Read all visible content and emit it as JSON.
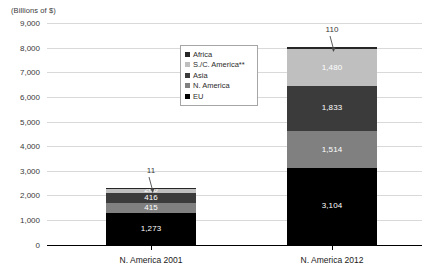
{
  "chart_data": {
    "type": "bar",
    "subtype": "stacked-bar",
    "title": "",
    "ylabel": "(Billions of $)",
    "xlabel": "",
    "ylim": [
      0,
      9000
    ],
    "ytick_labels": [
      "9,000",
      "8,000",
      "7,000",
      "6,000",
      "5,000",
      "4,000",
      "3,000",
      "2,000",
      "1,000",
      "0"
    ],
    "ytick_values": [
      9000,
      8000,
      7000,
      6000,
      5000,
      4000,
      3000,
      2000,
      1000,
      0
    ],
    "grid": true,
    "legend_position": "inside-upper-center",
    "categories": [
      "N. America 2001",
      "N. America 2012"
    ],
    "series": [
      {
        "name": "EU",
        "values": [
          1273,
          3104
        ],
        "labels": [
          "1,273",
          "3,104"
        ],
        "color": "#000000",
        "label_color": "#ffffff"
      },
      {
        "name": "N. America",
        "values": [
          415,
          1514
        ],
        "labels": [
          "415",
          "1,514"
        ],
        "color": "#808080",
        "label_color": "#ffffff"
      },
      {
        "name": "Asia",
        "values": [
          416,
          1833
        ],
        "labels": [
          "416",
          "1,833"
        ],
        "color": "#3b3b3b",
        "label_color": "#ffffff"
      },
      {
        "name": "S./C. America**",
        "values": [
          200,
          1480
        ],
        "labels": [
          "200",
          "1,480"
        ],
        "color": "#bfbfbf",
        "label_color": "#ffffff"
      },
      {
        "name": "Africa",
        "values": [
          11,
          110
        ],
        "labels": [
          "11",
          "110"
        ],
        "color": "#262626",
        "label_color": "#3a3a3a",
        "callout": true
      }
    ],
    "totals": [
      2315,
      8041
    ],
    "annotations": [
      {
        "text": "11",
        "series": "Africa",
        "category": "N. America 2001"
      },
      {
        "text": "110",
        "series": "Africa",
        "category": "N. America 2012"
      }
    ]
  },
  "legend": {
    "items": [
      {
        "label": "Africa",
        "color": "#262626"
      },
      {
        "label": "S./C. America**",
        "color": "#bfbfbf"
      },
      {
        "label": "Asia",
        "color": "#3b3b3b"
      },
      {
        "label": "N. America",
        "color": "#808080"
      },
      {
        "label": "EU",
        "color": "#000000"
      }
    ]
  },
  "axis": {
    "y_title": "(Billions of $)"
  }
}
